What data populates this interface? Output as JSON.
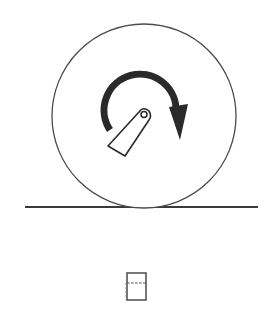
{
  "diagram": {
    "colors": {
      "stroke": "#3a3a3a",
      "arrow_fill": "#2a2a2a",
      "background": "#ffffff"
    },
    "wheel": {
      "cx": 144,
      "cy": 116,
      "r": 92
    },
    "ground": {
      "x1": 25,
      "x2": 258,
      "y": 207
    },
    "pivot": {
      "cx": 144,
      "cy": 115,
      "r": 3.5
    },
    "rotation_direction": "clockwise",
    "small_box": {
      "x": 127,
      "y": 273,
      "width": 19,
      "height": 27
    }
  }
}
